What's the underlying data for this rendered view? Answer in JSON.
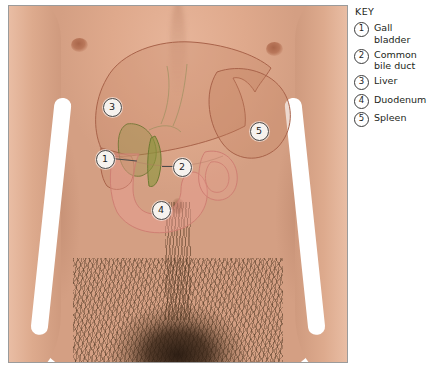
{
  "figure": {
    "kind": "anatomical-overlay-photograph",
    "panel_border_color": "#9b9b9b",
    "background_color": "#ffffff"
  },
  "photo": {
    "skin_color": "#e0a98c",
    "hair_color": "#3a2616",
    "features": [
      {
        "name": "left-nipple"
      },
      {
        "name": "right-nipple"
      },
      {
        "name": "navel"
      },
      {
        "name": "abdominal-hair"
      },
      {
        "name": "pubic-hair"
      },
      {
        "name": "left-arm"
      },
      {
        "name": "right-arm"
      }
    ]
  },
  "organs": [
    {
      "id": 3,
      "name": "Liver",
      "outline_color": "#a9634a",
      "fill_color": "rgba(190,122,92,0.30)",
      "marker": {
        "x": 102,
        "y": 100
      }
    },
    {
      "id": 5,
      "name": "Spleen",
      "outline_color": "#a9634a",
      "fill_color": "rgba(196,128,96,0.32)",
      "marker": {
        "x": 249,
        "y": 124
      }
    },
    {
      "id": 1,
      "name": "Gall bladder",
      "outline_color": "#7c7a3c",
      "fill_color": "rgba(150,146,72,0.42)",
      "marker": {
        "x": 95,
        "y": 152
      },
      "leader": {
        "x1": 103,
        "y1": 152,
        "x2": 128,
        "y2": 155
      }
    },
    {
      "id": 2,
      "name": "Common bile duct",
      "outline_color": "#6f7a32",
      "fill_color": "rgba(138,148,60,0.60)",
      "marker": {
        "x": 172,
        "y": 160
      },
      "leader": {
        "x1": 153,
        "y1": 160,
        "x2": 164,
        "y2": 160
      }
    },
    {
      "id": 4,
      "name": "Duodenum",
      "outline_color": "#cf7f73",
      "fill_color": "rgba(236,158,148,0.45)",
      "marker": {
        "x": 151,
        "y": 203
      }
    }
  ],
  "key": {
    "title": "KEY",
    "items": [
      {
        "number": "1",
        "label": "Gall bladder"
      },
      {
        "number": "2",
        "label": "Common bile duct"
      },
      {
        "number": "3",
        "label": "Liver"
      },
      {
        "number": "4",
        "label": "Duodenum"
      },
      {
        "number": "5",
        "label": "Spleen"
      }
    ]
  },
  "markers": {
    "m1": "1",
    "m2": "2",
    "m3": "3",
    "m4": "4",
    "m5": "5"
  }
}
